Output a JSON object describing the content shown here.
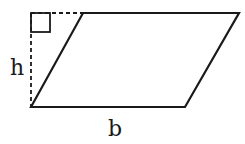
{
  "diagram": {
    "labels": {
      "height": "h",
      "base": "b"
    },
    "colors": {
      "stroke": "#1a1a1a",
      "background": "#ffffff"
    }
  }
}
